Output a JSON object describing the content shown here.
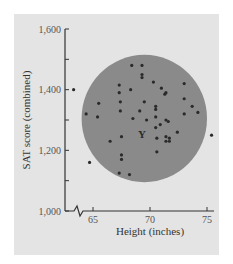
{
  "chart_data": {
    "type": "scatter",
    "title": "",
    "xlabel": "Height (inches)",
    "ylabel": "SAT score (combined)",
    "xlim": [
      62.5,
      75.5
    ],
    "ylim": [
      1000,
      1600
    ],
    "x_ticks": [
      65,
      70,
      75
    ],
    "x_tick_labels": [
      "65",
      "70",
      "75"
    ],
    "y_ticks": [
      1000,
      1100,
      1200,
      1300,
      1400,
      1500,
      1600
    ],
    "y_tick_labels": [
      "1,000",
      "",
      "1,200",
      "",
      "1,400",
      "",
      "1,600"
    ],
    "x_axis_break": true,
    "grid": false,
    "legend": null,
    "annotations": [
      {
        "type": "circle",
        "description": "shaded circular region enclosing most points",
        "center": [
          69.5,
          1305
        ],
        "radius_x_inches": 5.5,
        "radius_y_points": 210,
        "fill": "#8a8a8a"
      },
      {
        "type": "marker",
        "label": "Y",
        "x": 69.3,
        "y": 1255
      }
    ],
    "series": [
      {
        "name": "students",
        "points": [
          [
            63.3,
            1400
          ],
          [
            64.4,
            1320
          ],
          [
            65.5,
            1355
          ],
          [
            65.4,
            1310
          ],
          [
            64.7,
            1160
          ],
          [
            66.5,
            1230
          ],
          [
            67.3,
            1415
          ],
          [
            67.3,
            1390
          ],
          [
            67.4,
            1360
          ],
          [
            67.4,
            1330
          ],
          [
            67.5,
            1245
          ],
          [
            67.5,
            1185
          ],
          [
            67.5,
            1170
          ],
          [
            67.3,
            1125
          ],
          [
            68.2,
            1120
          ],
          [
            68.4,
            1480
          ],
          [
            68.3,
            1400
          ],
          [
            68.5,
            1305
          ],
          [
            69.1,
            1330
          ],
          [
            69.3,
            1480
          ],
          [
            69.3,
            1450
          ],
          [
            69.3,
            1440
          ],
          [
            69.5,
            1360
          ],
          [
            69.7,
            1300
          ],
          [
            70.3,
            1425
          ],
          [
            70.5,
            1345
          ],
          [
            70.5,
            1335
          ],
          [
            70.5,
            1310
          ],
          [
            70.5,
            1275
          ],
          [
            70.6,
            1240
          ],
          [
            70.6,
            1195
          ],
          [
            71.0,
            1405
          ],
          [
            70.9,
            1285
          ],
          [
            71.3,
            1385
          ],
          [
            71.4,
            1390
          ],
          [
            71.4,
            1300
          ],
          [
            71.4,
            1245
          ],
          [
            71.4,
            1230
          ],
          [
            71.7,
            1240
          ],
          [
            71.7,
            1230
          ],
          [
            71.6,
            1295
          ],
          [
            72.4,
            1260
          ],
          [
            73.0,
            1420
          ],
          [
            73.0,
            1370
          ],
          [
            73.0,
            1320
          ],
          [
            73.7,
            1345
          ],
          [
            74.2,
            1325
          ],
          [
            75.4,
            1250
          ]
        ]
      }
    ]
  },
  "colors": {
    "panel_bg": "#e4e4e4",
    "page_bg": "#ffffff",
    "circle_fill": "#8a8a8a",
    "point": "#2a2a2a",
    "axis": "#333333"
  }
}
